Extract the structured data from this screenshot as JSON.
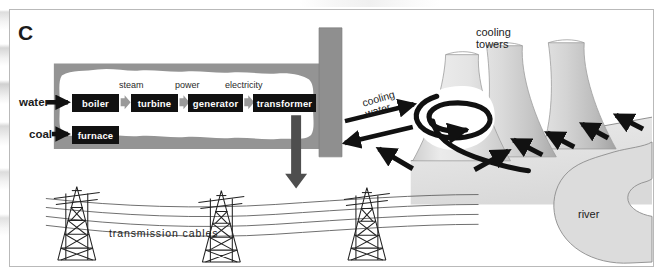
{
  "figure": {
    "panel_letter": "C",
    "caption_note": ""
  },
  "colors": {
    "box_fill": "#111111",
    "box_text": "#ffffff",
    "building_roof": "#8c8c8c",
    "building_wall": "#9a9a9a",
    "interior_white": "#ffffff",
    "tower_light": "#ededed",
    "tower_mid": "#d2d2d2",
    "tower_dark": "#b4b4b4",
    "ground_fill": "#e3e3e3",
    "river_fill": "#dcdcdc",
    "arrow_black": "#111111",
    "arrow_gray": "#9a9a9a",
    "outline": "#6e6e6e",
    "plate_border": "#b9b9b9",
    "cable": "#6f6f6f",
    "pylon": "#222222"
  },
  "power_station": {
    "inputs": [
      {
        "name": "water-input",
        "label": "water"
      },
      {
        "name": "coal-input",
        "label": "coal"
      }
    ],
    "process_boxes": [
      {
        "name": "boiler-box",
        "label": "boiler"
      },
      {
        "name": "turbine-box",
        "label": "turbine"
      },
      {
        "name": "generator-box",
        "label": "generator"
      },
      {
        "name": "transformer-box",
        "label": "transformer"
      },
      {
        "name": "furnace-box",
        "label": "furnace"
      }
    ],
    "flow_labels": [
      {
        "name": "steam-flow-label",
        "label": "steam"
      },
      {
        "name": "power-flow-label",
        "label": "power"
      },
      {
        "name": "electricity-flow-label",
        "label": "electricity"
      }
    ]
  },
  "cooling": {
    "towers_label": "cooling\ntowers",
    "towers_label_line1": "cooling",
    "towers_label_line2": "towers",
    "water_label_line1": "cooling",
    "water_label_line2": "water",
    "tower_count": 3,
    "air_arrow_count": 6
  },
  "landscape": {
    "river_label": "river"
  },
  "distribution": {
    "cables_label": "transmission  cables",
    "pylons_label": "pylons",
    "pylon_count": 3,
    "cable_count": 4
  }
}
